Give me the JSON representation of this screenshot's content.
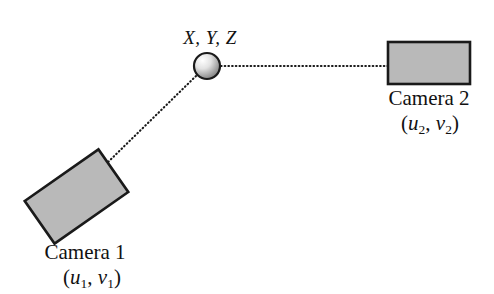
{
  "diagram": {
    "background_color": "#ffffff",
    "stroke_color": "#1a1a1a",
    "camera_fill_color": "#b9b9b9",
    "sphere_highlight_color": "#ffffff",
    "sphere_shadow_color": "#8c8c8c"
  },
  "point": {
    "label": "X, Y, Z",
    "shape": "sphere",
    "center_x": 207,
    "center_y": 66,
    "radius": 13
  },
  "cameras": [
    {
      "id": "camera-1",
      "name": "Camera 1",
      "coords_open": "(",
      "coords_u": "u",
      "coords_u_sub": "1",
      "coords_sep": ", ",
      "coords_v": "v",
      "coords_v_sub": "1",
      "coords_close": ")",
      "coords_text": "(u1, v1)",
      "rotation_deg": -35,
      "width": 90,
      "height": 52
    },
    {
      "id": "camera-2",
      "name": "Camera 2",
      "coords_open": "(",
      "coords_u": "u",
      "coords_u_sub": "2",
      "coords_sep": ", ",
      "coords_v": "v",
      "coords_v_sub": "2",
      "coords_close": ")",
      "coords_text": "(u2, v2)",
      "rotation_deg": 0,
      "width": 82,
      "height": 42
    }
  ],
  "rays": [
    {
      "id": "ray-to-camera-1",
      "style": "dotted",
      "from_x": 196,
      "from_y": 76,
      "to_x": 103,
      "to_y": 167
    },
    {
      "id": "ray-to-camera-2",
      "style": "dotted",
      "from_x": 221,
      "from_y": 66,
      "to_x": 388,
      "to_y": 66
    }
  ]
}
